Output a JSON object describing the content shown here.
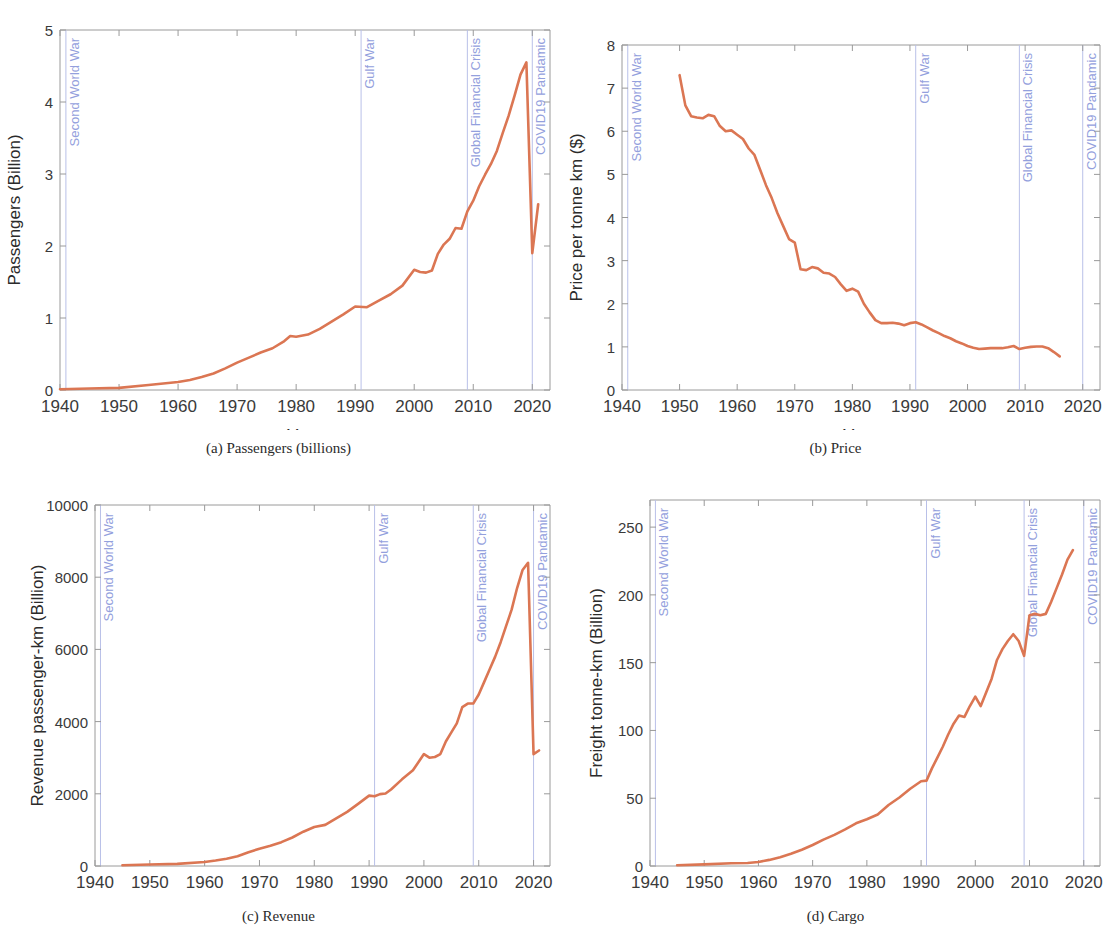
{
  "figure": {
    "panels": [
      {
        "id": "a",
        "caption": "(a) Passengers (billions)",
        "xlabel": "Year",
        "ylabel": "Passengers (Billion)",
        "xticks": [
          "1940",
          "1950",
          "1960",
          "1970",
          "1980",
          "1990",
          "2000",
          "2010",
          "2020"
        ],
        "yticks": [
          "0",
          "1",
          "2",
          "3",
          "4",
          "5"
        ]
      },
      {
        "id": "b",
        "caption": "(b) Price",
        "xlabel": "Year",
        "ylabel": "Price per tonne km ($)",
        "xticks": [
          "1940",
          "1950",
          "1960",
          "1970",
          "1980",
          "1990",
          "2000",
          "2010",
          "2020"
        ],
        "yticks": [
          "0",
          "1",
          "2",
          "3",
          "4",
          "5",
          "6",
          "7",
          "8"
        ]
      },
      {
        "id": "c",
        "caption": "(c) Revenue",
        "xlabel": "Year",
        "ylabel": "Revenue passenger-km (Billion)",
        "xticks": [
          "1940",
          "1950",
          "1960",
          "1970",
          "1980",
          "1990",
          "2000",
          "2010",
          "2020"
        ],
        "yticks": [
          "0",
          "2000",
          "4000",
          "6000",
          "8000",
          "10000"
        ]
      },
      {
        "id": "d",
        "caption": "(d) Cargo",
        "xlabel": "Year",
        "ylabel": "Freight tonne-km (Billion)",
        "xticks": [
          "1940",
          "1950",
          "1960",
          "1970",
          "1980",
          "1990",
          "2000",
          "2010",
          "2020"
        ],
        "yticks": [
          "0",
          "50",
          "100",
          "150",
          "200",
          "250"
        ]
      }
    ],
    "events": [
      {
        "name": "Second World War",
        "year": 1941
      },
      {
        "name": "Gulf War",
        "year": 1991
      },
      {
        "name": "Global Financial Crisis",
        "year": 2009
      },
      {
        "name": "COVID19 Pandamic",
        "year": 2020
      }
    ],
    "colors": {
      "series": "#DB7653",
      "event_line": "#c3c9ea",
      "event_label": "#93a0dd",
      "axis": "#9a9a9a",
      "text": "#3a3a3a"
    }
  },
  "chart_data": [
    {
      "type": "line",
      "id": "a",
      "title": "(a) Passengers (billions)",
      "xlabel": "Year",
      "ylabel": "Passengers (Billion)",
      "xlim": [
        1940,
        2023
      ],
      "ylim": [
        0,
        5
      ],
      "grid": false,
      "legend": "none",
      "annotations": [
        "Second World War",
        "Gulf War",
        "Global Financial Crisis",
        "COVID19 Pandamic"
      ],
      "x": [
        1940,
        1945,
        1950,
        1955,
        1960,
        1962,
        1964,
        1966,
        1968,
        1970,
        1972,
        1974,
        1976,
        1978,
        1979,
        1980,
        1982,
        1984,
        1986,
        1988,
        1990,
        1992,
        1994,
        1996,
        1998,
        2000,
        2001,
        2002,
        2003,
        2004,
        2005,
        2006,
        2007,
        2008,
        2009,
        2010,
        2011,
        2012,
        2013,
        2014,
        2015,
        2016,
        2017,
        2018,
        2019,
        2020,
        2021
      ],
      "y": [
        0.01,
        0.02,
        0.03,
        0.07,
        0.11,
        0.14,
        0.18,
        0.23,
        0.3,
        0.38,
        0.45,
        0.52,
        0.58,
        0.68,
        0.75,
        0.74,
        0.77,
        0.85,
        0.95,
        1.05,
        1.16,
        1.15,
        1.24,
        1.33,
        1.45,
        1.67,
        1.64,
        1.63,
        1.66,
        1.89,
        2.02,
        2.1,
        2.25,
        2.24,
        2.48,
        2.63,
        2.83,
        2.99,
        3.14,
        3.32,
        3.57,
        3.81,
        4.09,
        4.38,
        4.55,
        1.9,
        2.58
      ]
    },
    {
      "type": "line",
      "id": "b",
      "title": "(b) Price",
      "xlabel": "Year",
      "ylabel": "Price per tonne km ($)",
      "xlim": [
        1940,
        2023
      ],
      "ylim": [
        0,
        8
      ],
      "grid": false,
      "legend": "none",
      "annotations": [
        "Second World War",
        "Gulf War",
        "Global Financial Crisis",
        "COVID19 Pandamic"
      ],
      "x": [
        1950,
        1951,
        1952,
        1953,
        1954,
        1955,
        1956,
        1957,
        1958,
        1959,
        1960,
        1961,
        1962,
        1963,
        1964,
        1965,
        1966,
        1967,
        1968,
        1969,
        1970,
        1971,
        1972,
        1973,
        1974,
        1975,
        1976,
        1977,
        1978,
        1979,
        1980,
        1981,
        1982,
        1983,
        1984,
        1985,
        1986,
        1987,
        1988,
        1989,
        1990,
        1991,
        1992,
        1993,
        1994,
        1995,
        1996,
        1997,
        1998,
        1999,
        2000,
        2001,
        2002,
        2003,
        2004,
        2005,
        2006,
        2007,
        2008,
        2009,
        2010,
        2011,
        2012,
        2013,
        2014,
        2015,
        2016
      ],
      "y": [
        7.3,
        6.6,
        6.35,
        6.32,
        6.3,
        6.38,
        6.35,
        6.12,
        6.0,
        6.02,
        5.92,
        5.82,
        5.6,
        5.45,
        5.1,
        4.75,
        4.45,
        4.1,
        3.8,
        3.5,
        3.42,
        2.8,
        2.78,
        2.85,
        2.82,
        2.72,
        2.7,
        2.62,
        2.45,
        2.3,
        2.35,
        2.28,
        2.0,
        1.8,
        1.62,
        1.55,
        1.55,
        1.56,
        1.54,
        1.5,
        1.55,
        1.57,
        1.52,
        1.45,
        1.38,
        1.32,
        1.25,
        1.2,
        1.13,
        1.08,
        1.02,
        0.98,
        0.95,
        0.96,
        0.97,
        0.97,
        0.97,
        0.99,
        1.02,
        0.95,
        0.98,
        1.0,
        1.01,
        1.01,
        0.97,
        0.88,
        0.78
      ]
    },
    {
      "type": "line",
      "id": "c",
      "title": "(c) Revenue",
      "xlabel": "Year",
      "ylabel": "Revenue passenger-km (Billion)",
      "xlim": [
        1940,
        2023
      ],
      "ylim": [
        0,
        10000
      ],
      "grid": false,
      "legend": "none",
      "annotations": [
        "Second World War",
        "Gulf War",
        "Global Financial Crisis",
        "COVID19 Pandamic"
      ],
      "x": [
        1945,
        1950,
        1955,
        1960,
        1962,
        1964,
        1966,
        1968,
        1970,
        1972,
        1974,
        1976,
        1978,
        1980,
        1982,
        1984,
        1986,
        1988,
        1990,
        1991,
        1992,
        1993,
        1994,
        1996,
        1998,
        2000,
        2001,
        2002,
        2003,
        2004,
        2005,
        2006,
        2007,
        2008,
        2009,
        2010,
        2011,
        2012,
        2013,
        2014,
        2015,
        2016,
        2017,
        2018,
        2019,
        2020,
        2021
      ],
      "y": [
        20,
        40,
        60,
        110,
        150,
        200,
        270,
        380,
        480,
        560,
        660,
        790,
        950,
        1080,
        1140,
        1320,
        1500,
        1720,
        1950,
        1930,
        1990,
        2010,
        2120,
        2400,
        2650,
        3100,
        3000,
        3020,
        3100,
        3450,
        3700,
        3950,
        4400,
        4500,
        4500,
        4750,
        5100,
        5450,
        5800,
        6200,
        6650,
        7100,
        7700,
        8200,
        8400,
        3100,
        3200
      ]
    },
    {
      "type": "line",
      "id": "d",
      "title": "(d) Cargo",
      "xlabel": "Year",
      "ylabel": "Freight tonne-km (Billion)",
      "xlim": [
        1940,
        2023
      ],
      "ylim": [
        0,
        270
      ],
      "grid": false,
      "legend": "none",
      "annotations": [
        "Second World War",
        "Gulf War",
        "Global Financial Crisis",
        "COVID19 Pandamic"
      ],
      "x": [
        1945,
        1950,
        1955,
        1958,
        1960,
        1962,
        1964,
        1966,
        1968,
        1970,
        1972,
        1974,
        1976,
        1978,
        1980,
        1982,
        1984,
        1986,
        1988,
        1990,
        1991,
        1992,
        1993,
        1994,
        1995,
        1996,
        1997,
        1998,
        1999,
        2000,
        2001,
        2002,
        2003,
        2004,
        2005,
        2006,
        2007,
        2008,
        2009,
        2010,
        2011,
        2012,
        2013,
        2014,
        2015,
        2016,
        2017,
        2018
      ],
      "y": [
        0.5,
        1.2,
        2.0,
        2.2,
        3.0,
        4.5,
        6.5,
        9.0,
        12.0,
        15.5,
        19.5,
        23.0,
        27.0,
        31.5,
        34.5,
        38.0,
        45.0,
        50.5,
        57.0,
        62.5,
        63.0,
        72.0,
        80.0,
        88.0,
        97.0,
        105.0,
        111.0,
        110.0,
        118.0,
        125.0,
        118.0,
        128.0,
        138.0,
        152.0,
        160.0,
        166.0,
        171.0,
        166.0,
        155.0,
        185.0,
        186.0,
        185.0,
        186.0,
        195.0,
        205.0,
        215.0,
        226.0,
        233.0
      ]
    }
  ]
}
